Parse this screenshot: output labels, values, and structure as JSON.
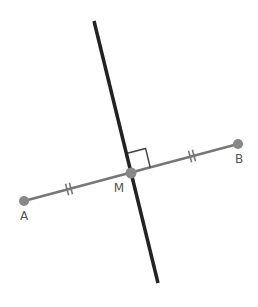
{
  "diagram": {
    "colors": {
      "segment": "#777777",
      "bisector": "#222222",
      "point": "#888888",
      "label": "#555555",
      "marker": "#444444"
    },
    "points": {
      "A": {
        "label": "A",
        "x": 24,
        "y": 201,
        "label_x": 24,
        "label_y": 220
      },
      "B": {
        "label": "B",
        "x": 238,
        "y": 144,
        "label_x": 239,
        "label_y": 163
      },
      "M": {
        "label": "M",
        "x": 131,
        "y": 173,
        "label_x": 119,
        "label_y": 192
      }
    },
    "bisector_line": {
      "x1": 94,
      "y1": 21,
      "x2": 158,
      "y2": 283
    },
    "tick_marks": [
      {
        "x": 69,
        "y": 189,
        "count": 2
      },
      {
        "x": 192,
        "y": 156,
        "count": 2
      }
    ],
    "right_angle": {
      "corner_x": 131,
      "corner_y": 173,
      "size": 20
    }
  }
}
